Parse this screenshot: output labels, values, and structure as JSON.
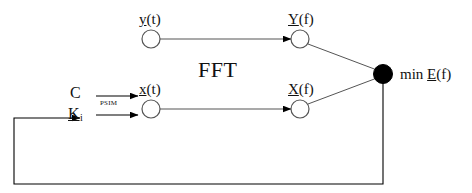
{
  "diagram": {
    "center_label": "FFT",
    "objective_prefix": "min",
    "objective_symbol": "E",
    "objective_arg": "(f)",
    "transform_label": "PSIM",
    "stroke_color": "#000000",
    "node_fill_open": "#ffffff",
    "node_fill_solid": "#000000",
    "background": "#ffffff"
  },
  "nodes": [
    {
      "id": "y-t",
      "label_sym": "y",
      "label_arg": "(t)",
      "label_full": "y(t)",
      "cx": 151,
      "cy": 39,
      "r": 9,
      "filled": false
    },
    {
      "id": "Y-f",
      "label_sym": "Y",
      "label_arg": "(f)",
      "label_full": "Y(f)",
      "cx": 300,
      "cy": 39,
      "r": 9,
      "filled": false
    },
    {
      "id": "x-t",
      "label_sym": "x",
      "label_arg": "(t)",
      "label_full": "x(t)",
      "cx": 151,
      "cy": 109,
      "r": 9,
      "filled": false
    },
    {
      "id": "X-f",
      "label_sym": "X",
      "label_arg": "(f)",
      "label_full": "X(f)",
      "cx": 300,
      "cy": 109,
      "r": 9,
      "filled": false
    },
    {
      "id": "min-e",
      "label_sym": "E",
      "label_arg": "(f)",
      "label_full": "min E(f)",
      "cx": 383,
      "cy": 74,
      "r": 9,
      "filled": true
    }
  ],
  "inputs": [
    {
      "id": "c-input",
      "label_sym": "C",
      "label_sub": "",
      "label_full": "C"
    },
    {
      "id": "k-i-input",
      "label_sym": "K",
      "label_sub": "i",
      "label_full": "K i"
    }
  ],
  "edges": [
    {
      "id": "c-to-xt",
      "from": "C",
      "to": "x(t)",
      "label": "PSIM"
    },
    {
      "id": "ki-to-xt",
      "from": "K i",
      "to": "x(t)",
      "label": "PSIM"
    },
    {
      "id": "yt-to-Yf",
      "from": "y(t)",
      "to": "Y(f)",
      "label": "FFT"
    },
    {
      "id": "xt-to-Xf",
      "from": "x(t)",
      "to": "X(f)",
      "label": "FFT"
    },
    {
      "id": "Yf-to-mine",
      "from": "Y(f)",
      "to": "min E(f)",
      "label": ""
    },
    {
      "id": "Xf-to-mine",
      "from": "X(f)",
      "to": "min E(f)",
      "label": ""
    },
    {
      "id": "feedback",
      "from": "min E(f)",
      "to": "K i",
      "label": ""
    }
  ]
}
